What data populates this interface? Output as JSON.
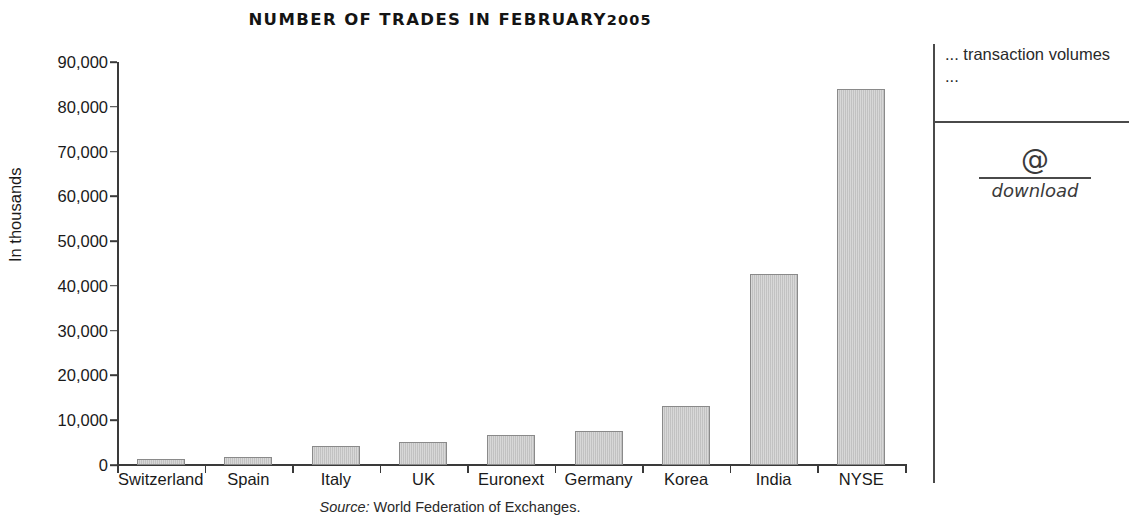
{
  "chart_data": {
    "type": "bar",
    "title_main": "NUMBER OF TRADES IN FEBRUARY",
    "title_year": "2005",
    "xlabel": "",
    "ylabel": "In thousands",
    "ylim": [
      0,
      90000
    ],
    "grid": false,
    "legend": "none",
    "categories": [
      "Switzerland",
      "Spain",
      "Italy",
      "UK",
      "Euronext",
      "Germany",
      "Korea",
      "India",
      "NYSE"
    ],
    "values": [
      1300,
      1800,
      4200,
      5100,
      6800,
      7500,
      13200,
      42700,
      84000
    ],
    "ytick_labels": [
      "90,000",
      "80,000",
      "70,000",
      "60,000",
      "50,000",
      "40,000",
      "30,000",
      "20,000",
      "10,000",
      "0"
    ],
    "ytick_values": [
      90000,
      80000,
      70000,
      60000,
      50000,
      40000,
      30000,
      20000,
      10000,
      0
    ],
    "bar_fill_color": "#c7c7c7",
    "bar_border_color": "#8a8a8a",
    "axis_color": "#3a3a3a"
  },
  "source_note": {
    "label": "Source:",
    "text": " World Federation of Exchanges."
  },
  "sidebar": {
    "caption": "... transaction volumes ...",
    "download": {
      "icon": "@",
      "label": "download"
    }
  }
}
